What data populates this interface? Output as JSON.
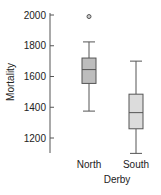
{
  "chart_data": {
    "type": "boxplot",
    "title": "",
    "xlabel": "Derby",
    "ylabel": "Mortality",
    "categories": [
      "North",
      "South"
    ],
    "yticks": [
      1200,
      1400,
      1600,
      1800,
      2000
    ],
    "ylim": [
      1100,
      2020
    ],
    "grid": false,
    "legend": "none",
    "series": [
      {
        "name": "North",
        "whisker_low": 1375,
        "q1": 1555,
        "median": 1645,
        "q3": 1720,
        "whisker_high": 1825,
        "outliers": [
          1990
        ],
        "fill": "#bdbdbd"
      },
      {
        "name": "South",
        "whisker_low": 1100,
        "q1": 1260,
        "median": 1365,
        "q3": 1485,
        "whisker_high": 1700,
        "outliers": [],
        "fill": "#dcdcdc"
      }
    ]
  }
}
